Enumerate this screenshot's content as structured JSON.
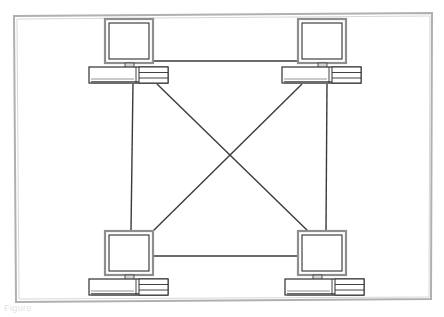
{
  "figure": {
    "kind": "network-topology-diagram",
    "caption": "Figure",
    "background_color": "#ffffff",
    "frame": {
      "label": "diagram-border",
      "color": "#a8a8a8",
      "x": 13,
      "y": 13,
      "width": 419,
      "height": 288
    },
    "line_color": "#3a3a3a",
    "device_outline_color": "#333333",
    "device_bezel_color": "#9a9a9a",
    "device_screen_color": "#ffffff",
    "device_fill_color": "#f7f7f7"
  },
  "nodes": [
    {
      "id": "pc-top-left",
      "label": "Computer top-left",
      "monitor": {
        "x": 105,
        "y": 19,
        "width": 48,
        "height": 44
      },
      "tower": {
        "x": 89,
        "y": 63,
        "width": 79,
        "height": 20
      },
      "port": {
        "x": 133,
        "y": 83
      }
    },
    {
      "id": "pc-top-right",
      "label": "Computer top-right",
      "monitor": {
        "x": 296,
        "y": 19,
        "width": 48,
        "height": 44
      },
      "tower": {
        "x": 281,
        "y": 63,
        "width": 79,
        "height": 20
      },
      "port": {
        "x": 325,
        "y": 83
      }
    },
    {
      "id": "pc-bottom-left",
      "label": "Computer bottom-left",
      "monitor": {
        "x": 105,
        "y": 230,
        "width": 48,
        "height": 44
      },
      "tower": {
        "x": 89,
        "y": 274,
        "width": 79,
        "height": 20
      },
      "port": {
        "x": 131,
        "y": 230
      }
    },
    {
      "id": "pc-bottom-right",
      "label": "Computer bottom-right",
      "monitor": {
        "x": 296,
        "y": 230,
        "width": 48,
        "height": 44
      },
      "tower": {
        "x": 281,
        "y": 274,
        "width": 79,
        "height": 20
      },
      "port": {
        "x": 325,
        "y": 230
      }
    }
  ],
  "links": [
    {
      "id": "link-top",
      "label": "top horizontal link",
      "from": "pc-top-left",
      "to": "pc-top-right",
      "x1": 153,
      "y1": 61,
      "x2": 298,
      "y2": 61
    },
    {
      "id": "link-left",
      "label": "left vertical link",
      "from": "pc-top-left",
      "to": "pc-bottom-left",
      "x1": 133,
      "y1": 83,
      "x2": 131,
      "y2": 230
    },
    {
      "id": "link-right",
      "label": "right vertical link",
      "from": "pc-top-right",
      "to": "pc-bottom-right",
      "x1": 327,
      "y1": 83,
      "x2": 326,
      "y2": 230
    },
    {
      "id": "link-bottom",
      "label": "bottom horizontal link",
      "from": "pc-bottom-left",
      "to": "pc-bottom-right",
      "x1": 153,
      "y1": 256,
      "x2": 298,
      "y2": 256
    },
    {
      "id": "link-diag-a",
      "label": "diagonal link top-left to bottom-right",
      "from": "pc-top-left",
      "to": "pc-bottom-right",
      "x1": 156,
      "y1": 84,
      "x2": 310,
      "y2": 232
    },
    {
      "id": "link-diag-b",
      "label": "diagonal link top-right to bottom-left",
      "from": "pc-top-right",
      "to": "pc-bottom-left",
      "x1": 303,
      "y1": 84,
      "x2": 150,
      "y2": 232
    }
  ],
  "counts": {
    "nodes": 4,
    "links": 6
  }
}
